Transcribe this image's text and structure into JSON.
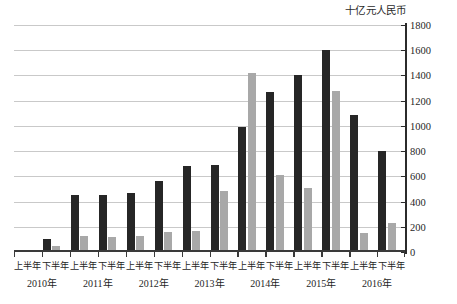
{
  "chart_data": {
    "type": "bar",
    "title": "",
    "subtitle": "",
    "unit_caption": "十亿元人民币",
    "xlabel": "",
    "ylabel": "",
    "ylim": [
      0,
      1800
    ],
    "ytick_step": 200,
    "yticks": [
      "0",
      "200",
      "400",
      "600",
      "800",
      "1000",
      "1200",
      "1400",
      "1600",
      "1800"
    ],
    "grid": true,
    "legend_position": "none",
    "categories": [
      "上半年",
      "下半年",
      "上半年",
      "下半年",
      "上半年",
      "下半年",
      "上半年",
      "下半年",
      "上半年",
      "下半年",
      "上半年",
      "下半年",
      "上半年",
      "下半年"
    ],
    "year_groups": [
      {
        "label": "2010年",
        "start_index": 0,
        "span": 2
      },
      {
        "label": "2011年",
        "start_index": 2,
        "span": 2
      },
      {
        "label": "2012年",
        "start_index": 4,
        "span": 2
      },
      {
        "label": "2013年",
        "start_index": 6,
        "span": 2
      },
      {
        "label": "2014年",
        "start_index": 8,
        "span": 2
      },
      {
        "label": "2015年",
        "start_index": 10,
        "span": 2
      },
      {
        "label": "2016年",
        "start_index": 12,
        "span": 2
      }
    ],
    "series": [
      {
        "name": "series-dark",
        "color": "#262626",
        "values": [
          10,
          100,
          450,
          450,
          470,
          560,
          680,
          690,
          990,
          1270,
          1400,
          1600,
          1090,
          800
        ]
      },
      {
        "name": "series-light",
        "color": "#a8a8a8",
        "values": [
          10,
          50,
          130,
          120,
          130,
          160,
          170,
          480,
          1420,
          610,
          510,
          1280,
          150,
          230
        ]
      }
    ]
  }
}
